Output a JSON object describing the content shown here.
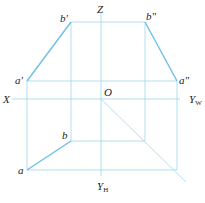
{
  "diagram": {
    "type": "orthographic projection (three views) of line segment AB",
    "colors": {
      "line": "#7ec8e8",
      "label": "#222222",
      "background": "#ffffff"
    },
    "axes": {
      "Z": "Z",
      "X": "X",
      "YW": "Y",
      "YW_sub": "W",
      "YH": "Y",
      "YH_sub": "H",
      "origin": "O"
    },
    "points": {
      "b_prime": "b'",
      "b_double_prime": "b\"",
      "a_prime": "a'",
      "a_double_prime": "a\"",
      "b": "b",
      "a": "a"
    }
  }
}
